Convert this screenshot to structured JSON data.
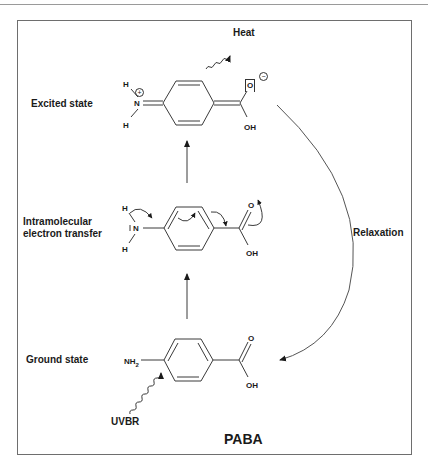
{
  "figure": {
    "title": "PABA",
    "states": {
      "excited": "Excited state",
      "intramolecular_line1": "Intramolecular",
      "intramolecular_line2": "electron transfer",
      "ground": "Ground state"
    },
    "processes": {
      "heat": "Heat",
      "relaxation": "Relaxation",
      "uvbr": "UVBR"
    },
    "atoms": {
      "excited": {
        "h_top": "H",
        "h_bottom": "H",
        "n": "N",
        "n_charge": "+",
        "o_minus": "O",
        "o_charge": "−",
        "oh": "OH"
      },
      "transfer": {
        "h_top": "H",
        "h_bottom": "H",
        "n": "N",
        "o": "O",
        "oh": "OH"
      },
      "ground": {
        "nh2": "NH",
        "nh2_sub": "2",
        "o": "O",
        "oh": "OH"
      }
    },
    "colors": {
      "line": "#2a2a2a",
      "text": "#1a1a1a",
      "frame": "#6e6e6e"
    }
  }
}
